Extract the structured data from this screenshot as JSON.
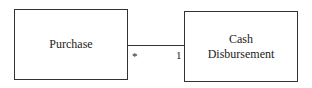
{
  "diagram": {
    "type": "uml-class-association",
    "entities": [
      {
        "id": "purchase",
        "label": "Purchase"
      },
      {
        "id": "cash",
        "label_line1": "Cash",
        "label_line2": "Disbursement"
      }
    ],
    "association": {
      "from": "Purchase",
      "to": "Cash Disbursement",
      "from_multiplicity": "*",
      "to_multiplicity": "1"
    }
  }
}
